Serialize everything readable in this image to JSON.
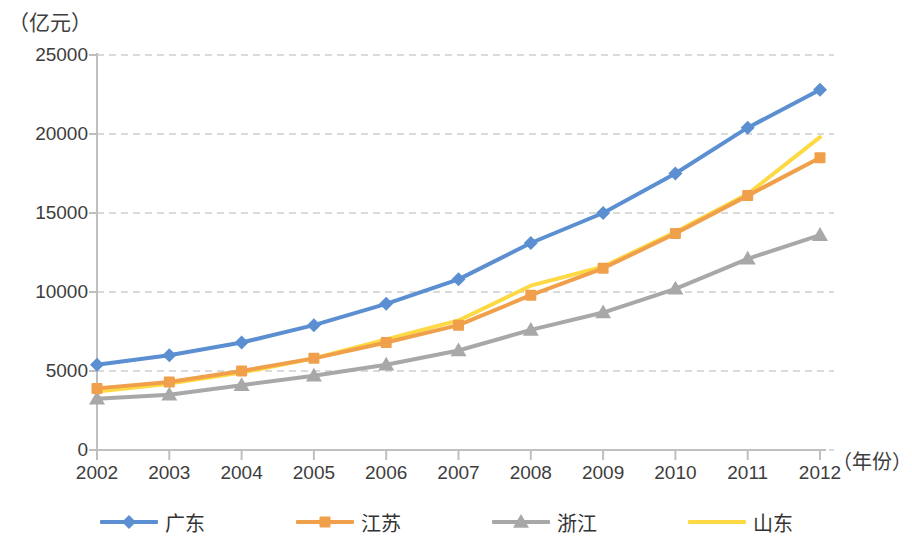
{
  "chart_data": {
    "type": "line",
    "title": "",
    "unit_label": "（亿元）",
    "xlabel": "（年份）",
    "ylabel": "",
    "categories": [
      "2002",
      "2003",
      "2004",
      "2005",
      "2006",
      "2007",
      "2008",
      "2009",
      "2010",
      "2011",
      "2012"
    ],
    "ylim": [
      0,
      25000
    ],
    "ytick_labels": [
      "0",
      "5000",
      "10000",
      "15000",
      "20000",
      "25000"
    ],
    "ytick_values": [
      0,
      5000,
      10000,
      15000,
      20000,
      25000
    ],
    "grid": "horizontal-dashed",
    "legend_position": "bottom",
    "series": [
      {
        "name": "广东",
        "color": "#5B8FD1",
        "marker": "diamond",
        "values": [
          5400,
          6000,
          6800,
          7900,
          9250,
          10800,
          13100,
          15000,
          17500,
          20400,
          22800
        ]
      },
      {
        "name": "江苏",
        "color": "#F0A04B",
        "marker": "square",
        "values": [
          3900,
          4300,
          5000,
          5800,
          6800,
          7900,
          9800,
          11500,
          13700,
          16100,
          18500
        ]
      },
      {
        "name": "浙江",
        "color": "#A8A8A8",
        "marker": "triangle",
        "values": [
          3250,
          3500,
          4100,
          4700,
          5400,
          6300,
          7600,
          8700,
          10200,
          12100,
          13600
        ]
      },
      {
        "name": "山东",
        "color": "#FDD944",
        "marker": "none",
        "values": [
          3700,
          4200,
          4900,
          5800,
          7000,
          8200,
          10400,
          11600,
          13800,
          16200,
          19800
        ]
      }
    ]
  },
  "axis": {
    "axis_color": "#BFBFBF",
    "grid_color": "#B5B5B5"
  },
  "legend": {
    "items": [
      {
        "label": "广东"
      },
      {
        "label": "江苏"
      },
      {
        "label": "浙江"
      },
      {
        "label": "山东"
      }
    ]
  }
}
